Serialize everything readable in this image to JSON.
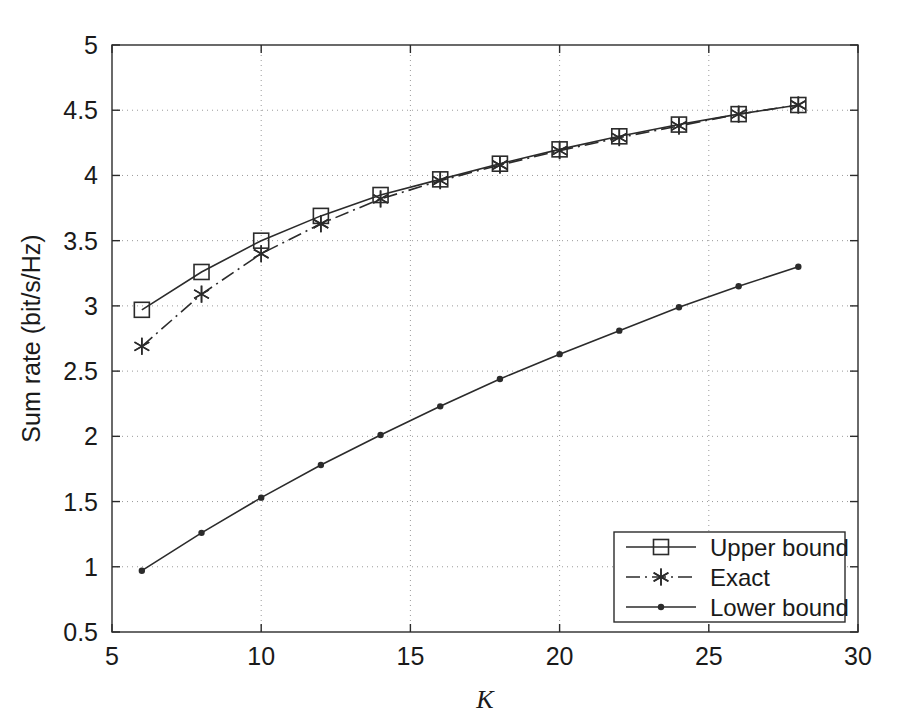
{
  "chart_data": {
    "type": "line",
    "title": "",
    "xlabel": "K",
    "ylabel": "Sum rate (bit/s/Hz)",
    "xlim": [
      5,
      30
    ],
    "ylim": [
      0.5,
      5
    ],
    "xticks": [
      5,
      10,
      15,
      20,
      25,
      30
    ],
    "yticks": [
      0.5,
      1,
      1.5,
      2,
      2.5,
      3,
      3.5,
      4,
      4.5,
      5
    ],
    "xtick_labels": [
      "5",
      "10",
      "15",
      "20",
      "25",
      "30"
    ],
    "ytick_labels": [
      "0.5",
      "1",
      "1.5",
      "2",
      "2.5",
      "3",
      "3.5",
      "4",
      "4.5",
      "5"
    ],
    "grid": true,
    "grid_style": "dotted",
    "legend_position": "lower right",
    "x": [
      6,
      8,
      10,
      12,
      14,
      16,
      18,
      20,
      22,
      24,
      26,
      28
    ],
    "series": [
      {
        "name": "Upper bound",
        "label": "Upper bound",
        "marker": "square",
        "linestyle": "solid",
        "color": "#2b2b2b",
        "values": [
          2.97,
          3.26,
          3.5,
          3.69,
          3.85,
          3.97,
          4.09,
          4.2,
          4.3,
          4.39,
          4.47,
          4.54
        ]
      },
      {
        "name": "Exact",
        "label": "Exact",
        "marker": "asterisk",
        "linestyle": "dashdot",
        "color": "#2b2b2b",
        "values": [
          2.69,
          3.09,
          3.4,
          3.63,
          3.82,
          3.96,
          4.08,
          4.19,
          4.29,
          4.38,
          4.47,
          4.54
        ]
      },
      {
        "name": "Lower bound",
        "label": "Lower bound",
        "marker": "dot",
        "linestyle": "solid",
        "color": "#2b2b2b",
        "values": [
          0.97,
          1.26,
          1.53,
          1.78,
          2.01,
          2.23,
          2.44,
          2.63,
          2.81,
          2.99,
          3.15,
          3.3
        ]
      }
    ]
  },
  "legend": {
    "entries": [
      {
        "label": "Upper bound",
        "marker": "square",
        "linestyle": "solid"
      },
      {
        "label": "Exact",
        "marker": "asterisk",
        "linestyle": "dashdot"
      },
      {
        "label": "Lower bound",
        "marker": "dot",
        "linestyle": "solid"
      }
    ]
  },
  "colors": {
    "foreground": "#2b2b2b",
    "background": "#ffffff",
    "grid": "#9a9a9a"
  }
}
